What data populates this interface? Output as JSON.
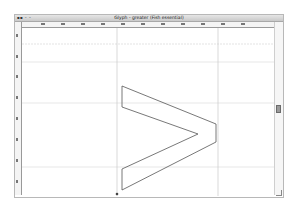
{
  "window": {
    "controls_label": "▪▪ ◦ ◦",
    "title": "Glyph - greater (Fish essential)"
  },
  "glyph": {
    "name": "greater",
    "character": ">",
    "outline_color": "#555555"
  },
  "guides": {
    "guide_color": "#c8c8c8",
    "horizontal_positions_px": [
      16,
      34,
      75,
      139,
      181
    ],
    "vertical_positions_px": [
      95,
      196
    ]
  },
  "rulers": {
    "horizontal_ticks": 11,
    "vertical_ticks": 8
  },
  "colors": {
    "titlebar": "#d4d4d4",
    "ruler_bg": "#f4f4f4",
    "canvas_bg": "#ffffff"
  }
}
